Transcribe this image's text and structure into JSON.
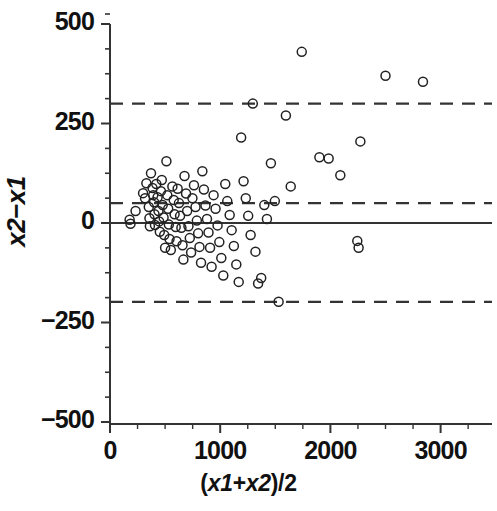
{
  "chart_data": {
    "type": "scatter",
    "title": "",
    "subtitle": "",
    "xlabel": "(x1+x2)/2",
    "ylabel": "x2-x1",
    "xlabel_parts": {
      "prefix": "(",
      "x1": "x1",
      "plus": "+",
      "x2": "x2",
      "suffix": ")/2"
    },
    "ylabel_parts": {
      "x2": "x2",
      "minus": "−",
      "x1": "x1"
    },
    "xlim": [
      0,
      3500
    ],
    "ylim": [
      -500,
      500
    ],
    "xticks": [
      0,
      1000,
      2000,
      3000
    ],
    "xtick_labels": [
      "0",
      "1000",
      "2000",
      "3000"
    ],
    "yticks": [
      -500,
      -250,
      0,
      250,
      500
    ],
    "ytick_labels": [
      "−500",
      "−250",
      "0",
      "250",
      "500"
    ],
    "x_minor_tick_interval": 250,
    "y_minor_tick_interval": 62.5,
    "grid": false,
    "legend": "none",
    "marker": {
      "shape": "circle",
      "filled": false,
      "edge_color": "#222222",
      "size": 9
    },
    "reference_lines": [
      {
        "name": "zero-line",
        "value": 0,
        "style": "solid",
        "color": "#333333",
        "width": 2.2
      },
      {
        "name": "bias-line",
        "value": 50,
        "style": "dashed",
        "color": "#333333",
        "width": 2.2
      },
      {
        "name": "upper-limit-of-agreement",
        "value": 300,
        "style": "dashed",
        "color": "#333333",
        "width": 2.2
      },
      {
        "name": "lower-limit-of-agreement",
        "value": -198,
        "style": "dashed",
        "color": "#333333",
        "width": 2.2
      }
    ],
    "n_points": 88,
    "points": [
      [
        178,
        8
      ],
      [
        186,
        -2
      ],
      [
        232,
        30
      ],
      [
        300,
        75
      ],
      [
        318,
        62
      ],
      [
        330,
        100
      ],
      [
        352,
        40
      ],
      [
        358,
        12
      ],
      [
        362,
        -8
      ],
      [
        372,
        125
      ],
      [
        386,
        88
      ],
      [
        392,
        70
      ],
      [
        400,
        52
      ],
      [
        404,
        22
      ],
      [
        408,
        -5
      ],
      [
        420,
        98
      ],
      [
        432,
        65
      ],
      [
        440,
        30
      ],
      [
        446,
        4
      ],
      [
        452,
        -22
      ],
      [
        462,
        80
      ],
      [
        470,
        108
      ],
      [
        478,
        45
      ],
      [
        486,
        14
      ],
      [
        492,
        -30
      ],
      [
        500,
        -62
      ],
      [
        512,
        155
      ],
      [
        520,
        70
      ],
      [
        528,
        36
      ],
      [
        534,
        -4
      ],
      [
        540,
        -40
      ],
      [
        552,
        -68
      ],
      [
        566,
        92
      ],
      [
        578,
        58
      ],
      [
        586,
        22
      ],
      [
        596,
        -10
      ],
      [
        604,
        -46
      ],
      [
        614,
        86
      ],
      [
        626,
        50
      ],
      [
        636,
        18
      ],
      [
        648,
        -12
      ],
      [
        658,
        -56
      ],
      [
        666,
        -92
      ],
      [
        676,
        118
      ],
      [
        690,
        74
      ],
      [
        700,
        30
      ],
      [
        712,
        -8
      ],
      [
        724,
        -38
      ],
      [
        736,
        -74
      ],
      [
        748,
        62
      ],
      [
        762,
        95
      ],
      [
        776,
        40
      ],
      [
        788,
        6
      ],
      [
        800,
        -26
      ],
      [
        812,
        -60
      ],
      [
        826,
        -100
      ],
      [
        838,
        130
      ],
      [
        852,
        84
      ],
      [
        866,
        44
      ],
      [
        880,
        10
      ],
      [
        894,
        -24
      ],
      [
        908,
        -62
      ],
      [
        922,
        -110
      ],
      [
        940,
        70
      ],
      [
        958,
        36
      ],
      [
        976,
        -6
      ],
      [
        992,
        -48
      ],
      [
        1010,
        -88
      ],
      [
        1028,
        -132
      ],
      [
        1046,
        98
      ],
      [
        1064,
        55
      ],
      [
        1086,
        20
      ],
      [
        1104,
        -18
      ],
      [
        1124,
        -58
      ],
      [
        1146,
        -104
      ],
      [
        1168,
        -148
      ],
      [
        1190,
        215
      ],
      [
        1212,
        105
      ],
      [
        1232,
        62
      ],
      [
        1254,
        18
      ],
      [
        1276,
        -30
      ],
      [
        1296,
        300
      ],
      [
        1320,
        -72
      ],
      [
        1344,
        -152
      ],
      [
        1372,
        -138
      ],
      [
        1400,
        45
      ],
      [
        1424,
        10
      ],
      [
        1460,
        150
      ],
      [
        1496,
        55
      ],
      [
        1530,
        -198
      ],
      [
        1596,
        270
      ],
      [
        1640,
        92
      ],
      [
        1740,
        430
      ],
      [
        1900,
        165
      ],
      [
        1984,
        162
      ],
      [
        2090,
        120
      ],
      [
        2244,
        -45
      ],
      [
        2256,
        -62
      ],
      [
        2272,
        205
      ],
      [
        2500,
        370
      ],
      [
        2840,
        355
      ]
    ]
  }
}
